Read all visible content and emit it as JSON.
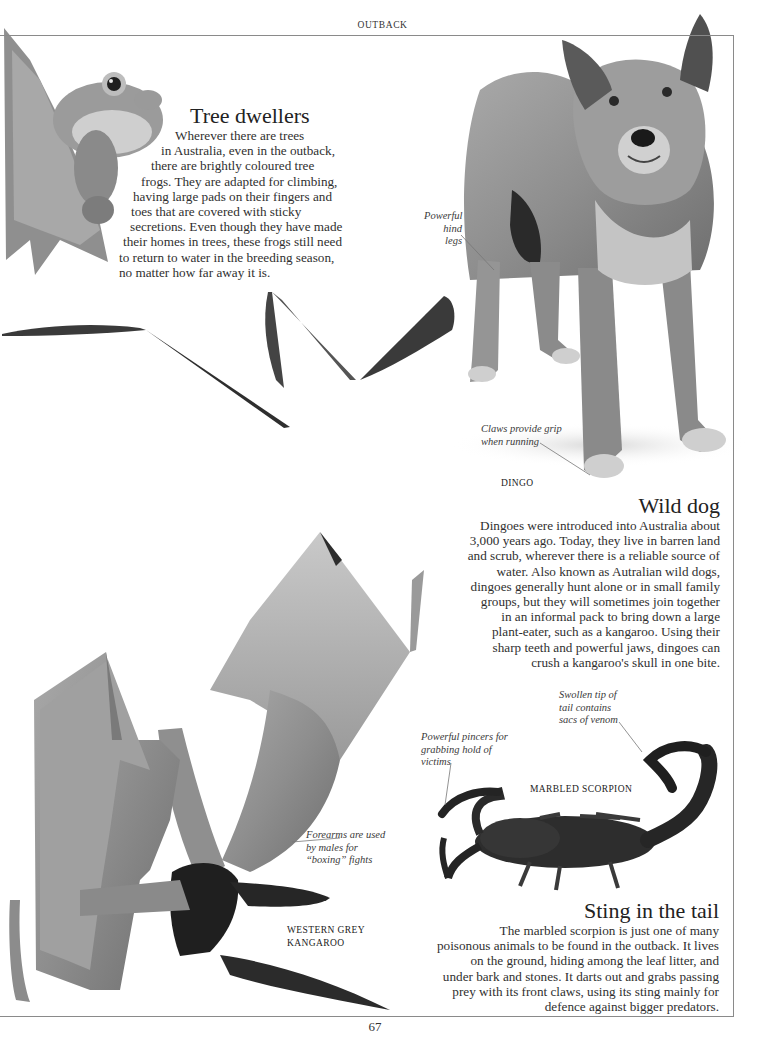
{
  "page": {
    "running_head": "OUTBACK",
    "folio": "67"
  },
  "sections": {
    "tree_dwellers": {
      "title": "Tree dwellers",
      "lines": [
        "Wherever there are trees",
        "in Australia, even in the outback,",
        "there are brightly coloured tree",
        "frogs. They are adapted for climbing,",
        "having large pads on their fingers and",
        "toes that are covered with sticky",
        "secretions. Even though they have made",
        "their homes in trees, these frogs still need",
        "to return to water in the breeding season,",
        "no matter how far away it is."
      ]
    },
    "wild_dog": {
      "title": "Wild dog",
      "lines": [
        "Dingoes were introduced into Australia about",
        "3,000 years ago. Today, they live in barren land",
        "and scrub, wherever there is a reliable source of",
        "water. Also known as Autralian wild dogs,",
        "dingoes generally hunt alone or in small family",
        "groups, but they will sometimes join together",
        "in an informal pack to bring down a large",
        "plant-eater, such as a kangaroo. Using their",
        "sharp teeth and powerful jaws, dingoes can",
        "crush a kangaroo's skull in one bite."
      ]
    },
    "sting_in_the_tail": {
      "title": "Sting in the tail",
      "lines": [
        "The marbled scorpion is just one of many",
        "poisonous animals to be found in the outback. It lives",
        "on the ground, hiding among the leaf litter, and",
        "under bark and stones. It darts out and grabs passing",
        "prey with its front claws, using its sting mainly for",
        "defence against bigger predators."
      ]
    }
  },
  "figures": {
    "frog": {
      "icon": "tree-frog-photo"
    },
    "dingo": {
      "icon": "dingo-photo",
      "label": "DINGO",
      "captions": {
        "hind_legs": [
          "Powerful",
          "hind legs"
        ],
        "claws": [
          "Claws provide grip",
          "when running"
        ]
      }
    },
    "kangaroo": {
      "icon": "kangaroo-photo",
      "label": [
        "WESTERN GREY",
        "KANGAROO"
      ],
      "captions": {
        "forearms": [
          "Forearms are used",
          "by males for",
          "“boxing” fights"
        ]
      }
    },
    "scorpion": {
      "icon": "scorpion-photo",
      "label": "MARBLED SCORPION",
      "captions": {
        "pincers": [
          "Powerful pincers for",
          "grabbing hold of",
          "victims"
        ],
        "tail": [
          "Swollen tip of",
          "tail contains",
          "sacs of venom"
        ]
      }
    }
  },
  "colors": {
    "rule": "#8a8a8a",
    "text": "#2f2f2f",
    "photo_dark": "#2a2a2a",
    "photo_mid": "#8c8c8c",
    "photo_light": "#c8c8c8"
  }
}
